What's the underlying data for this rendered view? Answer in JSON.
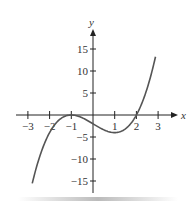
{
  "chart_data": {
    "type": "line",
    "title": "",
    "xlabel": "x",
    "ylabel": "y",
    "function": "y = (x+1)^2 (x-2)",
    "xlim": [
      -3,
      3
    ],
    "ylim": [
      -15,
      15
    ],
    "x_ticks": [
      "-3",
      "-2",
      "-1",
      "1",
      "2",
      "3"
    ],
    "y_ticks": [
      "15",
      "10",
      "5",
      "-5",
      "-10",
      "-15"
    ],
    "grid": false,
    "series": [
      {
        "name": "curve",
        "x": [
          -2.8,
          -2.5,
          -2,
          -1.5,
          -1,
          -0.5,
          0,
          0.5,
          1,
          1.5,
          2,
          2.5,
          2.9
        ],
        "y": [
          -15.6,
          -10.1,
          -4,
          -0.9,
          0,
          -0.6,
          -2,
          -3.4,
          -4,
          -3.1,
          0,
          5.6,
          13.7
        ]
      }
    ],
    "colors": {
      "curve": "#555555",
      "axes": "#222222"
    }
  }
}
